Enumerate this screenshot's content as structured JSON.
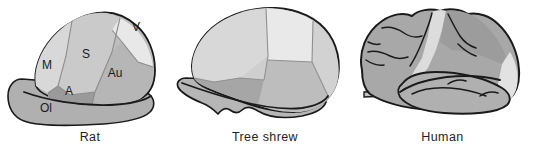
{
  "figure": {
    "background_color": "#ffffff",
    "outline_color": "#1a1a1a"
  },
  "palette": {
    "highlight": "#e8e8e8",
    "light_gray": "#d2d2d2",
    "mid_gray": "#bdbdbd",
    "base_gray": "#b0b0b0",
    "dark_gray": "#9a9a9a",
    "outline": "#1a1a1a",
    "label_text": "#1a1a1a",
    "caption_text": "#231f20"
  },
  "panels": [
    {
      "id": "rat",
      "caption": "Rat",
      "labels": [
        {
          "key": "m",
          "text": "M",
          "name": "motor-cortex-label",
          "x": 47,
          "y": 69
        },
        {
          "key": "s",
          "text": "S",
          "name": "somatosensory-cortex-label",
          "x": 86,
          "y": 58
        },
        {
          "key": "v",
          "text": "V",
          "name": "visual-cortex-label",
          "x": 136,
          "y": 31
        },
        {
          "key": "au",
          "text": "Au",
          "name": "auditory-cortex-label",
          "x": 115,
          "y": 77
        },
        {
          "key": "a",
          "text": "A",
          "name": "association-cortex-label",
          "x": 69,
          "y": 95
        },
        {
          "key": "ol",
          "text": "Ol",
          "name": "olfactory-bulb-label",
          "x": 46,
          "y": 112
        }
      ]
    },
    {
      "id": "tree-shrew",
      "caption": "Tree shrew",
      "labels": []
    },
    {
      "id": "human",
      "caption": "Human",
      "labels": []
    }
  ]
}
